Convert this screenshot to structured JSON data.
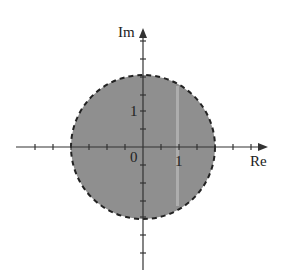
{
  "diagram": {
    "axes": {
      "x_label": "Re",
      "y_label": "Im",
      "origin_label": "0",
      "x_tick_label": "1",
      "y_tick_label": "1"
    },
    "region": {
      "shape": "open disk",
      "center": [
        0,
        0
      ],
      "radius": 2,
      "boundary": "dashed",
      "fill_color": "#8c8c8c",
      "boundary_color": "#222222"
    },
    "colors": {
      "axis": "#333333",
      "background": "#ffffff"
    }
  }
}
